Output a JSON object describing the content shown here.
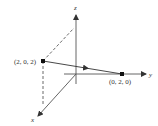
{
  "diagram": {
    "type": "3d-coordinate-axes",
    "axes": {
      "x": {
        "label": "x"
      },
      "y": {
        "label": "y"
      },
      "z": {
        "label": "z"
      }
    },
    "points": [
      {
        "id": "p1",
        "label": "(2, 0, 2)",
        "coords": [
          2,
          0,
          2
        ]
      },
      {
        "id": "p2",
        "label": "(0, 2, 0)",
        "coords": [
          0,
          2,
          0
        ]
      }
    ],
    "segments": [
      {
        "from": "p1",
        "to": "p2",
        "style": "solid",
        "directed": true
      },
      {
        "from": "p1",
        "to": "z-axis projection",
        "style": "dashed"
      },
      {
        "from": "p1",
        "to": "x-axis projection",
        "style": "dashed"
      }
    ],
    "colors": {
      "line": "#333333",
      "background": "#ffffff"
    }
  }
}
